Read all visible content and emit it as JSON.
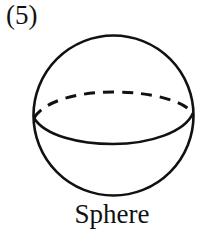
{
  "figure": {
    "number_label": "(5)",
    "caption": "Sphere",
    "shape": "sphere",
    "stroke_color": "#111111",
    "elements": [
      "outline-circle",
      "front-equator-solid",
      "back-equator-dashed"
    ]
  }
}
